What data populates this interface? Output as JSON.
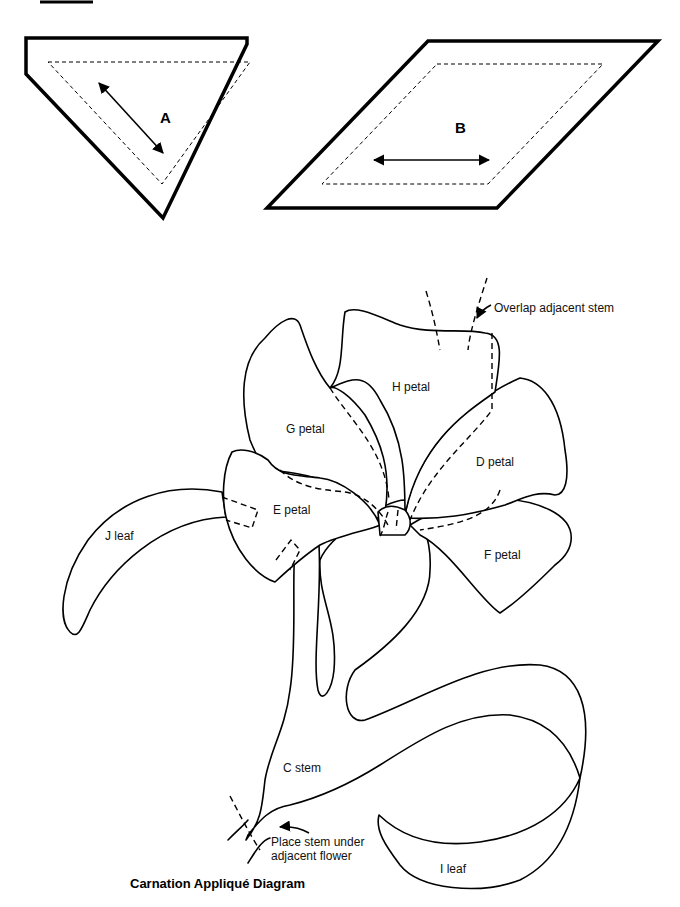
{
  "diagram": {
    "title": "Carnation Appliqué Diagram",
    "templates": [
      {
        "id": "A",
        "label": "A",
        "shape": "pentagon (triangle with clipped corner)",
        "grain": "diagonal"
      },
      {
        "id": "B",
        "label": "B",
        "shape": "parallelogram",
        "grain": "horizontal"
      }
    ],
    "pieces": {
      "h": "H petal",
      "g": "G petal",
      "d": "D petal",
      "e": "E petal",
      "f": "F petal",
      "j": "J leaf",
      "c": "C stem",
      "i": "I leaf"
    },
    "annotations": {
      "overlap": "Overlap adjacent stem",
      "place_line1": "Place stem under",
      "place_line2": "adjacent flower"
    },
    "colors": {
      "ink": "#000000",
      "paper": "#ffffff"
    }
  }
}
